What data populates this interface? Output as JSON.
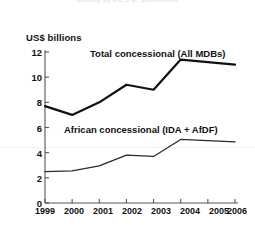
{
  "figure": {
    "cut_title": "lending by the 5 yr, 2003–2006",
    "background_color": "#ffffff",
    "line_color": "#111111"
  },
  "axis": {
    "y_unit_label": "US$ billions",
    "y_ticks": [
      "0",
      "2",
      "4",
      "6",
      "8",
      "10",
      "12"
    ],
    "x_ticks": [
      "1999",
      "2000",
      "2001",
      "2002",
      "2003",
      "2004",
      "2005",
      "2006"
    ]
  },
  "labels": {
    "total": "Total concessional (All MDBs)",
    "african": "African concessional (IDA + AfDF)"
  },
  "chart_data": {
    "type": "line",
    "title": "",
    "xlabel": "",
    "ylabel": "US$ billions",
    "ylim": [
      0,
      12
    ],
    "ytick_step": 2,
    "grid": false,
    "legend_position": "inline-annotations",
    "x": [
      "1999",
      "2000",
      "2001",
      "2002",
      "2003",
      "2004",
      "2005",
      "2006"
    ],
    "series": [
      {
        "name": "Total concessional (All MDBs)",
        "values": [
          7.7,
          7.0,
          8.0,
          9.4,
          9.0,
          11.4,
          11.2,
          11.0
        ],
        "color": "#111111",
        "line_width": 2.2
      },
      {
        "name": "African concessional (IDA + AfDF)",
        "values": [
          2.5,
          2.55,
          2.95,
          3.8,
          3.7,
          5.05,
          4.95,
          4.85
        ],
        "color": "#2b2b2b",
        "line_width": 1.3
      }
    ]
  }
}
